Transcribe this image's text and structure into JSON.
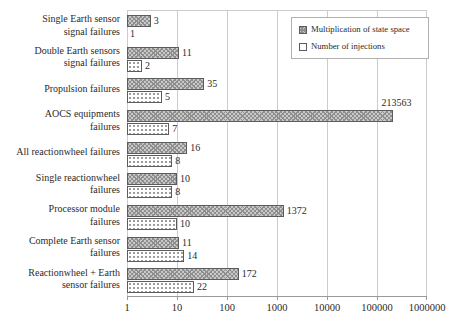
{
  "chart_data": {
    "type": "bar",
    "orientation": "horizontal",
    "x_scale": "log",
    "xlim": [
      1,
      1000000
    ],
    "x_ticks": [
      "1",
      "10",
      "100",
      "1000",
      "10000",
      "100000",
      "1000000"
    ],
    "grid": "vertical",
    "legend_position": "top-right",
    "title": "",
    "xlabel": "",
    "ylabel": "",
    "categories": [
      {
        "label_lines": [
          "Single Earth sensor",
          "signal failures"
        ]
      },
      {
        "label_lines": [
          "Double Earth sensors",
          "signal failures"
        ]
      },
      {
        "label_lines": [
          "Propulsion failures"
        ]
      },
      {
        "label_lines": [
          "AOCS equipments",
          "failures"
        ]
      },
      {
        "label_lines": [
          "All reactionwheel failures"
        ]
      },
      {
        "label_lines": [
          "Single reactionwheel",
          "failures"
        ]
      },
      {
        "label_lines": [
          "Processor module",
          "failures"
        ]
      },
      {
        "label_lines": [
          "Complete Earth sensor",
          "failures"
        ]
      },
      {
        "label_lines": [
          "Reactionwheel + Earth",
          "sensor failures"
        ]
      }
    ],
    "series": [
      {
        "name": "Multiplication of state space",
        "pattern": "hatch",
        "values": [
          3,
          11,
          35,
          213563,
          16,
          10,
          1372,
          11,
          172
        ]
      },
      {
        "name": "Number of injections",
        "pattern": "dots",
        "values": [
          1,
          2,
          5,
          7,
          8,
          8,
          10,
          14,
          22
        ]
      }
    ],
    "colors": {
      "text": "#2b2b2b",
      "grid": "#cccccc",
      "axis": "#999999",
      "bar_border": "#5c5c5c",
      "hatch_fill": "#c9c9c9",
      "hatch_line": "#8f8f8f",
      "dot_color": "#999999"
    }
  }
}
